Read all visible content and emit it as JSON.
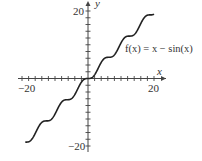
{
  "chart_data": {
    "type": "line",
    "title": "",
    "function_label": "f(x) = x − sin(x)",
    "xlabel": "x",
    "ylabel": "y",
    "xlim": [
      -20,
      20
    ],
    "ylim": [
      -20,
      20
    ],
    "x_tick_labels": [
      "−20",
      "20"
    ],
    "y_tick_labels": [
      "20",
      "−20"
    ],
    "tick_spacing": 2,
    "grid": false,
    "legend": "none",
    "series": [
      {
        "name": "f(x) = x − sin(x)",
        "x_range": [
          -19,
          20
        ],
        "sample_points": [
          {
            "x": -19,
            "y": -18.85
          },
          {
            "x": -15,
            "y": -14.35
          },
          {
            "x": -12.57,
            "y": -12.57
          },
          {
            "x": -10,
            "y": -10.54
          },
          {
            "x": -6.28,
            "y": -6.28
          },
          {
            "x": -3,
            "y": -2.86
          },
          {
            "x": 0,
            "y": 0
          },
          {
            "x": 3,
            "y": 2.86
          },
          {
            "x": 6.28,
            "y": 6.28
          },
          {
            "x": 10,
            "y": 10.54
          },
          {
            "x": 12.57,
            "y": 12.57
          },
          {
            "x": 15,
            "y": 14.35
          },
          {
            "x": 20,
            "y": 19.09
          }
        ]
      }
    ]
  },
  "colors": {
    "curve": "#222222",
    "axis": "#444444",
    "text": "#333333"
  }
}
